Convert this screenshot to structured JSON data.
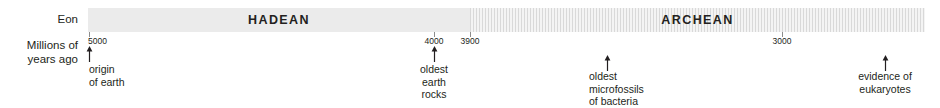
{
  "figure": {
    "width": 940,
    "height": 108,
    "background": "#ffffff",
    "text_color": "#231f20"
  },
  "row_labels": {
    "eon": "Eon",
    "scale_line1": "Millions of",
    "scale_line2": "years ago"
  },
  "chart_data": {
    "type": "timeline",
    "title": "",
    "xlabel": "Millions of years ago",
    "ylabel": "",
    "axis_direction": "decreasing-left-to-right",
    "axis_range_mya": [
      5000,
      2700
    ],
    "grid": false,
    "legend": "none",
    "tick_labels": [
      "5000",
      "4000",
      "3900",
      "3000"
    ],
    "ticks": [
      {
        "label": "5000",
        "value_mya": 5000,
        "x": 89,
        "anchor": "start"
      },
      {
        "label": "4000",
        "value_mya": 4000,
        "x": 434,
        "anchor": "middle"
      },
      {
        "label": "3900",
        "value_mya": 3900,
        "x": 470,
        "anchor": "middle"
      },
      {
        "label": "3000",
        "value_mya": 3000,
        "x": 782,
        "anchor": "middle"
      }
    ],
    "eons": [
      {
        "name": "HADEAN",
        "start_mya": 5000,
        "end_mya": 3900,
        "x": 0,
        "width": 382,
        "fill": "#ebebeb",
        "pattern": "solid"
      },
      {
        "name": "ARCHEAN",
        "start_mya": 3900,
        "end_mya": 2700,
        "x": 382,
        "width": 455,
        "fill": "#eeeeee",
        "pattern": "vertical-stripes"
      }
    ],
    "events": [
      {
        "id": "origin-of-earth",
        "lines": [
          "origin",
          "of earth"
        ],
        "value_mya": 5000,
        "x": 89,
        "align": "left",
        "text_x": 89,
        "arrow_top": 46,
        "text_top": 63
      },
      {
        "id": "oldest-earth-rocks",
        "lines": [
          "oldest",
          "earth",
          "rocks"
        ],
        "value_mya": 4000,
        "x": 434,
        "align": "center",
        "text_x": 434,
        "arrow_top": 46,
        "text_top": 63
      },
      {
        "id": "oldest-microfossils-of-bacteria",
        "lines": [
          "oldest",
          "microfossils",
          "of bacteria"
        ],
        "value_mya": 3500,
        "x": 607,
        "align": "left",
        "text_x": 589,
        "arrow_top": 55,
        "text_top": 70
      },
      {
        "id": "evidence-of-eukaryotes",
        "lines": [
          "evidence of",
          "eukaryotes"
        ],
        "value_mya": 2800,
        "x": 885,
        "align": "center",
        "text_x": 885,
        "arrow_top": 55,
        "text_top": 70
      }
    ]
  }
}
